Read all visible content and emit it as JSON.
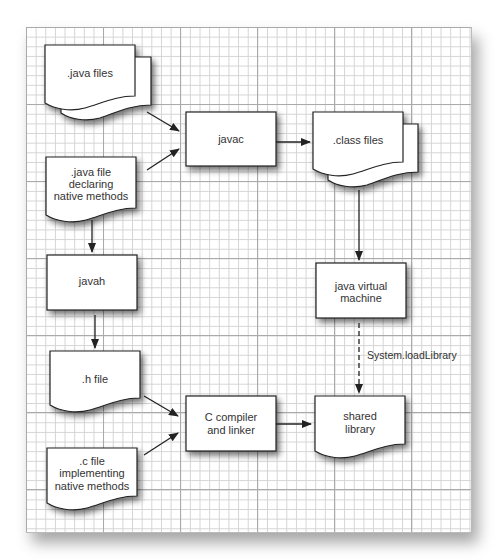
{
  "diagram": {
    "type": "flowchart",
    "colors": {
      "grid_minor": "#d4d4d4",
      "grid_major": "#aaaaaa",
      "node_fill": "#ffffff",
      "node_stroke": "#222222",
      "text": "#333333",
      "arrow": "#222222"
    },
    "nodes": {
      "java_files": {
        "shape": "multi-document",
        "lines": [
          ".java files"
        ]
      },
      "java_file_native": {
        "shape": "document",
        "lines": [
          ".java file",
          "declaring",
          "native methods"
        ]
      },
      "javac": {
        "shape": "process",
        "lines": [
          "javac"
        ]
      },
      "class_files": {
        "shape": "multi-document",
        "lines": [
          ".class files"
        ]
      },
      "javah": {
        "shape": "process",
        "lines": [
          "javah"
        ]
      },
      "jvm": {
        "shape": "process",
        "lines": [
          "java virtual",
          "machine"
        ]
      },
      "h_file": {
        "shape": "document",
        "lines": [
          ".h file"
        ]
      },
      "c_compiler": {
        "shape": "process",
        "lines": [
          "C compiler",
          "and linker"
        ]
      },
      "shared_library": {
        "shape": "document",
        "lines": [
          "shared",
          "library"
        ]
      },
      "c_file": {
        "shape": "document",
        "lines": [
          ".c file",
          "implementing",
          "native methods"
        ]
      }
    },
    "edges": [
      {
        "from": "java_files",
        "to": "javac",
        "style": "solid"
      },
      {
        "from": "java_file_native",
        "to": "javac",
        "style": "solid"
      },
      {
        "from": "javac",
        "to": "class_files",
        "style": "solid"
      },
      {
        "from": "java_file_native",
        "to": "javah",
        "style": "solid"
      },
      {
        "from": "javah",
        "to": "h_file",
        "style": "solid"
      },
      {
        "from": "class_files",
        "to": "jvm",
        "style": "solid"
      },
      {
        "from": "jvm",
        "to": "shared_library",
        "style": "dashed",
        "label": "System.loadLibrary"
      },
      {
        "from": "h_file",
        "to": "c_compiler",
        "style": "solid"
      },
      {
        "from": "c_file",
        "to": "c_compiler",
        "style": "solid"
      },
      {
        "from": "c_compiler",
        "to": "shared_library",
        "style": "solid"
      }
    ]
  }
}
